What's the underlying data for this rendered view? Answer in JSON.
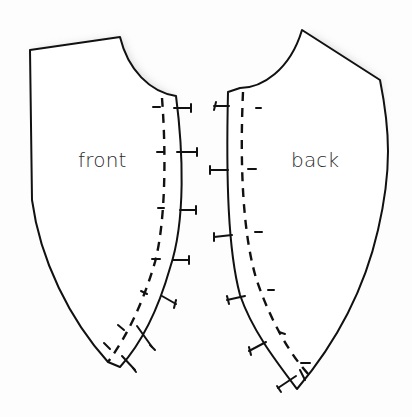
{
  "diagram": {
    "type": "sewing-pattern",
    "pieces": [
      {
        "id": "front",
        "label": "front",
        "seam_side": "right",
        "tick_count": 9
      },
      {
        "id": "back",
        "label": "back",
        "seam_side": "left",
        "tick_count": 7
      }
    ],
    "colors": {
      "background": "#fdfdfd",
      "outline": "#111111",
      "shading": "#d9d9d9",
      "label": "#2a2a2a"
    }
  }
}
